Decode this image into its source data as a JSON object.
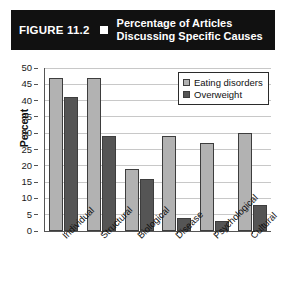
{
  "figure": {
    "number": "FIGURE 11.2",
    "bullet_icon": "square-bullet-icon",
    "title_line1": "Percentage of Articles",
    "title_line2": "Discussing Specific Causes",
    "title_bar_color": "#111111",
    "title_text_color": "#ffffff"
  },
  "chart_data": {
    "type": "bar",
    "title": "Percentage of Articles Discussing Specific Causes",
    "xlabel": "",
    "ylabel": "Percent",
    "ylim": [
      0,
      50
    ],
    "ytick_step": 5,
    "yticks": [
      "50",
      "45",
      "40",
      "35",
      "30",
      "25",
      "20",
      "15",
      "10",
      "5",
      "0"
    ],
    "grid": true,
    "legend_position": "top-right",
    "categories": [
      "Individual",
      "Structural",
      "Biological",
      "Disease",
      "Psychological",
      "Cultural"
    ],
    "series": [
      {
        "name": "Eating disorders",
        "color": "#b2b2b2",
        "values": [
          47,
          47,
          19,
          29,
          27,
          30
        ]
      },
      {
        "name": "Overweight",
        "color": "#555555",
        "values": [
          41,
          29,
          16,
          4,
          3,
          8
        ]
      }
    ]
  }
}
